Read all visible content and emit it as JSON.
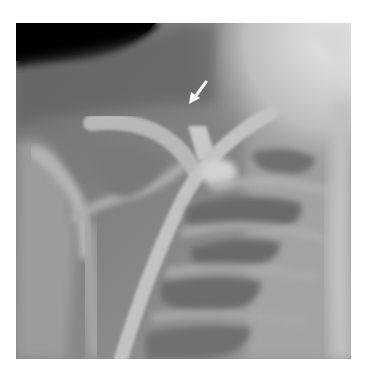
{
  "figure": {
    "type": "radiograph",
    "annotation": {
      "kind": "arrow",
      "color": "#ffffff",
      "direction": "down-left"
    },
    "colors": {
      "background": "#ffffff",
      "air_dark": "#0a0a0a",
      "soft_tissue": "#7e7e7e",
      "bone_light": "#c4c4c4"
    }
  }
}
